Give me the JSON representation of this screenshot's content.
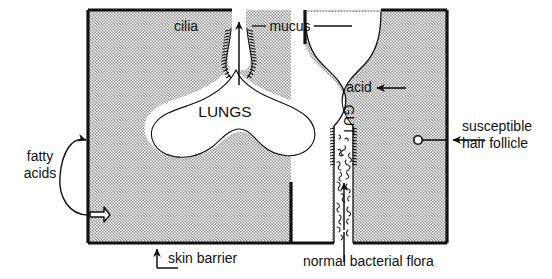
{
  "figure": {
    "colors": {
      "outline": "#111111",
      "tissue_fill": "#d6d6d6",
      "lumen_fill": "#ffffff",
      "text": "#111111",
      "background": "#ffffff"
    }
  },
  "labels": {
    "cilia": "cilia",
    "mucus": "mucus",
    "lungs": "LUNGS",
    "acid": "acid",
    "gut": "GUT",
    "susceptible_line1": "susceptible",
    "susceptible_line2": "hair follicle",
    "fatty_line1": "fatty",
    "fatty_line2": "acids",
    "skin_barrier": "skin barrier",
    "normal_flora": "normal bacterial flora"
  },
  "structures": [
    {
      "name": "body-tissue-left",
      "description": "stippled tissue block, left side of torso"
    },
    {
      "name": "body-tissue-right",
      "description": "stippled tissue block, right side of torso"
    },
    {
      "name": "lung-cavity",
      "description": "butterfly shaped white lung space"
    },
    {
      "name": "trachea-airway",
      "description": "vertical airway leading up from lungs"
    },
    {
      "name": "stomach-cavity",
      "description": "bulging white stomach space containing acid"
    },
    {
      "name": "gut-lumen",
      "description": "vertical gut channel containing bacterial flora"
    },
    {
      "name": "hair-follicle",
      "description": "small circular follicle opening in skin"
    },
    {
      "name": "fatty-acid-vent",
      "description": "jagged arrow on skin surface emitting fatty acids"
    }
  ],
  "arrows": [
    {
      "name": "mucociliary-escalator-arrow",
      "direction": "up",
      "meaning": "mucus and cilia sweep upward"
    },
    {
      "name": "acid-arrow",
      "direction": "left",
      "meaning": "points to stomach acid"
    },
    {
      "name": "gut-flora-arrow",
      "direction": "up",
      "meaning": "points to normal bacterial flora"
    },
    {
      "name": "skin-barrier-arrow",
      "direction": "up",
      "meaning": "points to skin barrier"
    },
    {
      "name": "hair-follicle-arrow",
      "direction": "left",
      "meaning": "points to susceptible hair follicle"
    },
    {
      "name": "fatty-acids-arrow",
      "direction": "up-right",
      "meaning": "curved leader to fatty acid vent"
    }
  ]
}
